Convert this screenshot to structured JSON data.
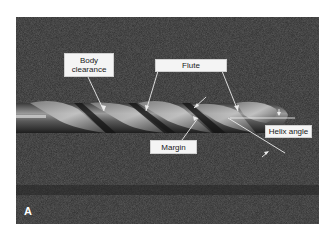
{
  "figure": {
    "panel_letter": "A",
    "labels": {
      "body_clearance": "Body\nclearance",
      "body_clearance_line1": "Body",
      "body_clearance_line2": "clearance",
      "flute": "Flute",
      "margin": "Margin",
      "helix_angle": "Helix angle"
    },
    "colors": {
      "background": "#2b2b2b",
      "label_fill": "#f4f4f4",
      "leader_line": "#e8e8e8",
      "drill_steel": "#6a6a6a"
    }
  }
}
